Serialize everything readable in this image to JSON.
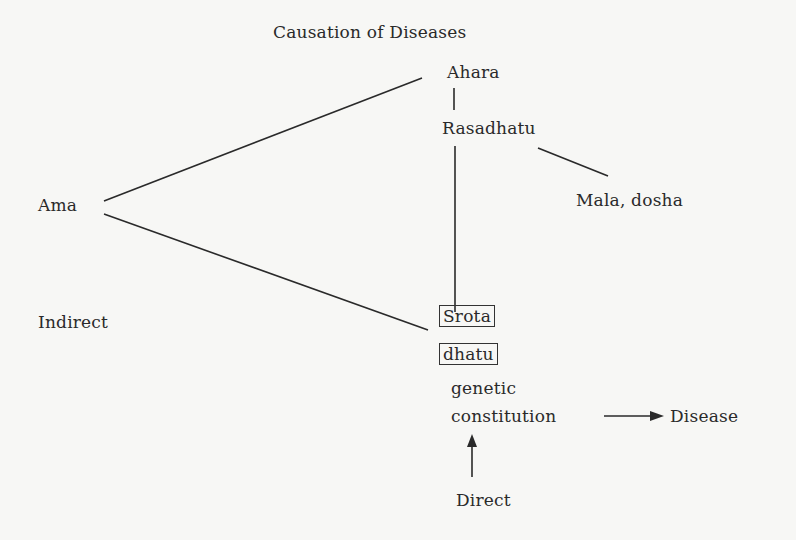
{
  "title": "Causation of Diseases",
  "nodes": {
    "ahara": "Ahara",
    "rasadhatu": "Rasadhatu",
    "mala_dosha": "Mala, dosha",
    "ama": "Ama",
    "indirect": "Indirect",
    "srota": "Srota",
    "dhatu": "dhatu",
    "genetic": "genetic",
    "constitution": "constitution",
    "disease": "Disease",
    "direct": "Direct"
  }
}
